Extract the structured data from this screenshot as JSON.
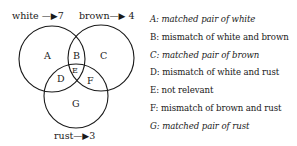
{
  "diagram": {
    "sets": [
      {
        "name": "white",
        "count": "7",
        "arrow": "—▶"
      },
      {
        "name": "brown",
        "count": "4",
        "arrow": "—▶"
      },
      {
        "name": "rust",
        "count": "3",
        "arrow": "—▶"
      }
    ],
    "regions": [
      "A",
      "B",
      "C",
      "D",
      "E",
      "F",
      "G"
    ]
  },
  "legend": [
    {
      "text": "A: matched pair of white",
      "italic": true
    },
    {
      "text": "B: mismatch of white and brown",
      "italic": false
    },
    {
      "text": "C: matched pair of brown",
      "italic": true
    },
    {
      "text": "D: mismatch of white and rust",
      "italic": false
    },
    {
      "text": "E: not relevant",
      "italic": false
    },
    {
      "text": "F: mismatch of brown and rust",
      "italic": false
    },
    {
      "text": "G: matched pair of rust",
      "italic": true
    }
  ]
}
